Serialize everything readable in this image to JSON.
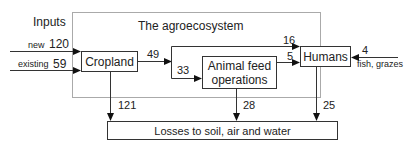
{
  "diagram": {
    "inputs_label": "Inputs",
    "system_label": "The agroecosystem",
    "nodes": {
      "cropland": "Cropland",
      "animal_feed_line1": "Animal feed",
      "animal_feed_line2": "operations",
      "humans": "Humans",
      "losses": "Losses to soil, air and water"
    },
    "flows": {
      "new_label": "new",
      "new_value": "120",
      "existing_label": "existing",
      "existing_value": "59",
      "cropland_out": "49",
      "to_feed": "33",
      "to_humans_top": "16",
      "feed_to_humans": "5",
      "fish_value": "4",
      "fish_label": "fish, grazes",
      "cropland_loss": "121",
      "feed_loss": "28",
      "humans_loss": "25"
    }
  }
}
